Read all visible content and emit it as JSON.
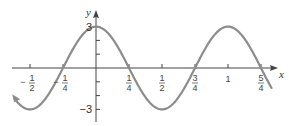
{
  "chart_data": {
    "type": "line",
    "title": "",
    "xlabel": "x",
    "ylabel": "y",
    "function": "y = 3cos(2πx)",
    "xlim": [
      -0.62,
      1.37
    ],
    "ylim": [
      -3.5,
      4
    ],
    "grid": false,
    "x_ticks": [
      {
        "value": -0.5,
        "num": "1",
        "den": "2",
        "sign": "−"
      },
      {
        "value": -0.25,
        "num": "1",
        "den": "4",
        "sign": "−"
      },
      {
        "value": 0.25,
        "num": "1",
        "den": "4",
        "sign": ""
      },
      {
        "value": 0.5,
        "num": "1",
        "den": "2",
        "sign": ""
      },
      {
        "value": 0.75,
        "num": "3",
        "den": "4",
        "sign": ""
      },
      {
        "value": 1,
        "num": "1",
        "den": "",
        "sign": ""
      },
      {
        "value": 1.25,
        "num": "5",
        "den": "4",
        "sign": ""
      }
    ],
    "y_ticks": [
      -3,
      -2,
      -1,
      1,
      2,
      3
    ],
    "y_tick_labels": [
      {
        "value": 3,
        "label": "3"
      },
      {
        "value": -3,
        "label": "−3"
      }
    ],
    "series": [
      {
        "name": "3cos(2πx)",
        "x": [
          -0.62,
          -0.5,
          -0.25,
          0,
          0.25,
          0.5,
          0.75,
          1,
          1.25,
          1.33
        ],
        "y": [
          -2.18,
          -3,
          0,
          3,
          0,
          -3,
          0,
          3,
          0,
          -1.5
        ]
      }
    ],
    "colors": {
      "curve": "#8c8c8c",
      "axis": "#444444"
    }
  }
}
